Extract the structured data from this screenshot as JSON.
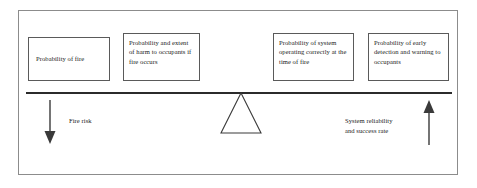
{
  "diagram": {
    "frame_color": "#8c8c8c",
    "line_color": "#2b2b2b",
    "box_border_color": "#5a5a5a",
    "text_color": "#1a1a1a",
    "left_side": {
      "boxes": [
        {
          "id": "probability-of-fire",
          "text": "Probability of fire"
        },
        {
          "id": "harm-to-occupants",
          "text": "Probability and extent of harm to occupants if fire occurs"
        }
      ],
      "arrow_direction": "down",
      "label": "Fire risk"
    },
    "right_side": {
      "boxes": [
        {
          "id": "system-operating-correctly",
          "text": "Probability of system operating correctly at the time of fire"
        },
        {
          "id": "early-detection-warning",
          "text": "Probability of early detection and warning to occupants"
        }
      ],
      "arrow_direction": "up",
      "label": "System reliability\nand success rate"
    },
    "fulcrum": {
      "shape": "triangle"
    }
  }
}
